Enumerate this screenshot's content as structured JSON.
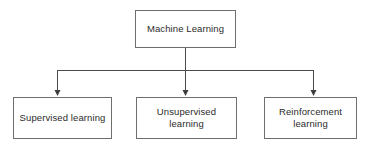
{
  "diagram": {
    "type": "tree",
    "orientation": "top-down",
    "background_color": "#ffffff",
    "box_border_color": "#6e6e6e",
    "connector_color": "#4a4a4a",
    "text_color": "#2b2b2b",
    "root": {
      "id": "root",
      "label": "Machine Learning"
    },
    "children": [
      {
        "id": "supervised",
        "label": "Supervised learning"
      },
      {
        "id": "unsupervised",
        "label": "Unsupervised\nlearning"
      },
      {
        "id": "reinforcement",
        "label": "Reinforcement\nlearning"
      }
    ]
  }
}
